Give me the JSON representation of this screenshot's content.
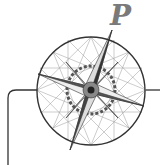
{
  "logo": {
    "letter": "P",
    "description": "compass-rose",
    "colors": {
      "stroke": "#333333",
      "fine_lines": "#888888",
      "letter": "#7a7a7a",
      "background": "#ffffff"
    }
  }
}
